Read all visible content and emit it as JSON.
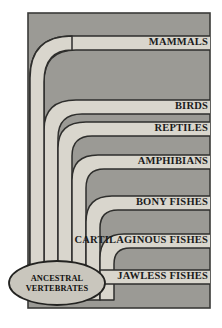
{
  "figure": {
    "type": "cladogram",
    "panel": {
      "background_color": "#9b9a95",
      "border_color": "#3a3a38",
      "branch_fill_color": "#d9d6cd",
      "branch_outline_color": "#2e2e2c",
      "page_background": "#ffffff"
    },
    "root": {
      "label_line1": "ANCESTRAL",
      "label_line2": "VERTEBRATES",
      "shape": "ellipse",
      "fill_color": "#c9c6bd",
      "outline_color": "#232321"
    },
    "tips": [
      {
        "label": "MAMMALS",
        "order": 1
      },
      {
        "label": "BIRDS",
        "order": 2
      },
      {
        "label": "REPTILES",
        "order": 3
      },
      {
        "label": "AMPHIBIANS",
        "order": 4
      },
      {
        "label": "BONY FISHES",
        "order": 5
      },
      {
        "label": "CARTILAGINOUS FISHES",
        "order": 6
      },
      {
        "label": "JAWLESS FISHES",
        "order": 7
      }
    ]
  }
}
